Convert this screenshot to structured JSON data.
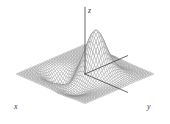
{
  "figure": {
    "background_color": "#ffffff",
    "width": 170,
    "height": 124
  },
  "axes": {
    "x_label": "x",
    "y_label": "y",
    "z_label": "z",
    "axis_color": "#454545",
    "axis_line_width": 0.8
  },
  "chart_data": {
    "type": "surface",
    "title": "",
    "xlabel": "x",
    "ylabel": "y",
    "zlabel": "z",
    "grid": true,
    "legend": null,
    "render": "wireframe-mesh",
    "mesh_color": "#8a8a8a",
    "mesh_fill": "#ffffff",
    "mesh_line_width": 0.35,
    "n_u": 44,
    "n_v": 44,
    "xlim": [
      -3.2,
      3.2
    ],
    "ylim": [
      -3.2,
      3.2
    ],
    "zlim": [
      -0.75,
      1.0
    ],
    "function": "peaks",
    "gaussian_terms": [
      {
        "amplitude": 1.0,
        "x0": -0.45,
        "y0": 0.55,
        "sx": 0.95,
        "sy": 0.95
      },
      {
        "amplitude": 0.34,
        "x0": -1.85,
        "y0": -0.35,
        "sx": 0.78,
        "sy": 0.8
      },
      {
        "amplitude": -0.46,
        "x0": 1.05,
        "y0": -1.25,
        "sx": 0.85,
        "sy": 0.85
      },
      {
        "amplitude": -0.16,
        "x0": 1.9,
        "y0": 1.05,
        "sx": 0.95,
        "sy": 0.95
      },
      {
        "amplitude": 0.1,
        "x0": -1.3,
        "y0": 1.85,
        "sx": 0.9,
        "sy": 0.9
      }
    ],
    "projection": {
      "type": "oblique-isometric",
      "origin_x": 85,
      "origin_y": 74,
      "x_axis_screen": [
        -0.93,
        0.4
      ],
      "y_axis_screen": [
        0.93,
        0.4
      ],
      "z_axis_screen": [
        0,
        -1
      ],
      "x_scale": 11.6,
      "y_scale": 11.6,
      "z_scale": 44
    },
    "axis_segments": [
      {
        "name": "x-axis",
        "from": [
          -3.95,
          0
        ],
        "to": [
          0,
          0
        ],
        "z": 0
      },
      {
        "name": "y-axis",
        "from": [
          0,
          0
        ],
        "to": [
          0,
          3.95
        ],
        "z": 0
      },
      {
        "name": "z-axis",
        "from": 0,
        "to": 1.52,
        "label_at_top": true
      }
    ]
  }
}
